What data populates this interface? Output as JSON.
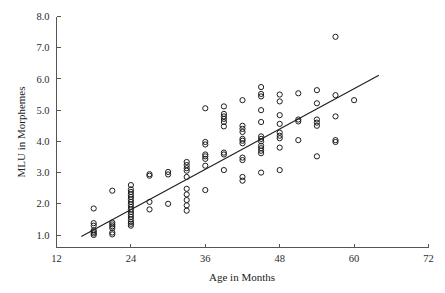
{
  "chart_data": {
    "type": "scatter",
    "title": "",
    "xlabel": "Age in Months",
    "ylabel": "MLU in Morphemes",
    "xlim": [
      12,
      72
    ],
    "ylim": [
      0.6,
      8.0
    ],
    "xticks": [
      12,
      24,
      36,
      48,
      60,
      72
    ],
    "xtick_labels": [
      "12",
      "24",
      "36",
      "48",
      "60",
      "72"
    ],
    "yticks": [
      1.0,
      2.0,
      3.0,
      4.0,
      5.0,
      6.0,
      7.0,
      8.0
    ],
    "ytick_labels": [
      "1.0",
      "2.0",
      "3.0",
      "4.0",
      "5.0",
      "6.0",
      "7.0",
      "8.0"
    ],
    "grid": false,
    "legend": null,
    "marker": "open-circle",
    "marker_color": "#1d1d1d",
    "points": [
      [
        18,
        1.0
      ],
      [
        18,
        1.05
      ],
      [
        18,
        1.1
      ],
      [
        18,
        1.15
      ],
      [
        18,
        1.3
      ],
      [
        18,
        1.38
      ],
      [
        18,
        1.85
      ],
      [
        21,
        1.02
      ],
      [
        21,
        1.08
      ],
      [
        21,
        1.22
      ],
      [
        21,
        1.28
      ],
      [
        21,
        1.34
      ],
      [
        21,
        1.4
      ],
      [
        21,
        2.42
      ],
      [
        24,
        1.3
      ],
      [
        24,
        1.36
      ],
      [
        24,
        1.42
      ],
      [
        24,
        1.5
      ],
      [
        24,
        1.58
      ],
      [
        24,
        1.66
      ],
      [
        24,
        1.74
      ],
      [
        24,
        1.82
      ],
      [
        24,
        1.9
      ],
      [
        24,
        1.98
      ],
      [
        24,
        2.06
      ],
      [
        24,
        2.14
      ],
      [
        24,
        2.22
      ],
      [
        24,
        2.3
      ],
      [
        24,
        2.38
      ],
      [
        24,
        2.46
      ],
      [
        24,
        2.6
      ],
      [
        27,
        1.82
      ],
      [
        27,
        2.06
      ],
      [
        27,
        2.9
      ],
      [
        27,
        2.95
      ],
      [
        30,
        2.0
      ],
      [
        30,
        2.94
      ],
      [
        30,
        3.02
      ],
      [
        33,
        1.78
      ],
      [
        33,
        1.95
      ],
      [
        33,
        2.12
      ],
      [
        33,
        2.3
      ],
      [
        33,
        2.48
      ],
      [
        33,
        2.86
      ],
      [
        33,
        3.06
      ],
      [
        33,
        3.14
      ],
      [
        33,
        3.24
      ],
      [
        33,
        3.34
      ],
      [
        36,
        2.44
      ],
      [
        36,
        3.22
      ],
      [
        36,
        3.44
      ],
      [
        36,
        3.52
      ],
      [
        36,
        3.58
      ],
      [
        36,
        3.9
      ],
      [
        36,
        3.98
      ],
      [
        36,
        5.06
      ],
      [
        39,
        3.08
      ],
      [
        39,
        3.58
      ],
      [
        39,
        3.64
      ],
      [
        39,
        4.48
      ],
      [
        39,
        4.62
      ],
      [
        39,
        4.72
      ],
      [
        39,
        4.8
      ],
      [
        39,
        4.88
      ],
      [
        39,
        5.12
      ],
      [
        42,
        2.74
      ],
      [
        42,
        2.86
      ],
      [
        42,
        3.4
      ],
      [
        42,
        3.48
      ],
      [
        42,
        3.94
      ],
      [
        42,
        4.02
      ],
      [
        42,
        4.08
      ],
      [
        42,
        4.3
      ],
      [
        42,
        4.4
      ],
      [
        42,
        4.5
      ],
      [
        42,
        5.32
      ],
      [
        45,
        3.0
      ],
      [
        45,
        3.62
      ],
      [
        45,
        3.7
      ],
      [
        45,
        3.78
      ],
      [
        45,
        3.86
      ],
      [
        45,
        4.0
      ],
      [
        45,
        4.08
      ],
      [
        45,
        4.16
      ],
      [
        45,
        4.62
      ],
      [
        45,
        5.0
      ],
      [
        45,
        5.44
      ],
      [
        45,
        5.52
      ],
      [
        45,
        5.74
      ],
      [
        48,
        3.08
      ],
      [
        48,
        3.8
      ],
      [
        48,
        4.1
      ],
      [
        48,
        4.18
      ],
      [
        48,
        4.28
      ],
      [
        48,
        4.56
      ],
      [
        48,
        4.84
      ],
      [
        48,
        5.28
      ],
      [
        48,
        5.5
      ],
      [
        51,
        4.04
      ],
      [
        51,
        4.64
      ],
      [
        51,
        4.7
      ],
      [
        51,
        5.54
      ],
      [
        54,
        3.52
      ],
      [
        54,
        4.5
      ],
      [
        54,
        4.6
      ],
      [
        54,
        4.7
      ],
      [
        54,
        5.22
      ],
      [
        54,
        5.64
      ],
      [
        57,
        3.98
      ],
      [
        57,
        4.04
      ],
      [
        57,
        4.8
      ],
      [
        57,
        5.48
      ],
      [
        57,
        7.35
      ],
      [
        60,
        5.32
      ]
    ],
    "regression_line": {
      "x_start": 16.0,
      "y_start": 0.95,
      "x_end": 64.0,
      "y_end": 6.12
    },
    "n_points": 110
  },
  "axes": {
    "x_axis_title": "Age in Months",
    "y_axis_title": "MLU in Morphemes"
  }
}
